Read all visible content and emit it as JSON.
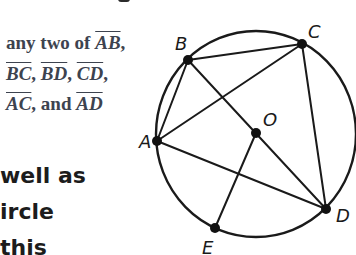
{
  "text_top": {
    "lines": [
      {
        "prefix": "any two of ",
        "segments": [
          "AB"
        ],
        "suffix": ","
      },
      {
        "segments": [
          "BC",
          "BD",
          "CD"
        ],
        "separator": ", ",
        "suffix": ","
      },
      {
        "segments": [
          "AC",
          "AD"
        ],
        "middle": ", and "
      }
    ]
  },
  "text_bottom": {
    "lines": [
      "well as",
      "ircle",
      "this"
    ]
  },
  "diagram": {
    "circle": {
      "center_label": "O"
    },
    "points": {
      "A": {
        "label": "A",
        "x": 157,
        "y": 141
      },
      "B": {
        "label": "B",
        "x": 188,
        "y": 60
      },
      "C": {
        "label": "C",
        "x": 302,
        "y": 44
      },
      "D": {
        "label": "D",
        "x": 326,
        "y": 209
      },
      "E": {
        "label": "E",
        "x": 215,
        "y": 228
      },
      "O": {
        "label": "O",
        "x": 256,
        "y": 133
      }
    },
    "segments": [
      "AB",
      "BC",
      "AC",
      "BD",
      "CD",
      "AD",
      "OE"
    ],
    "stroke_color": "#1a1a1a"
  }
}
